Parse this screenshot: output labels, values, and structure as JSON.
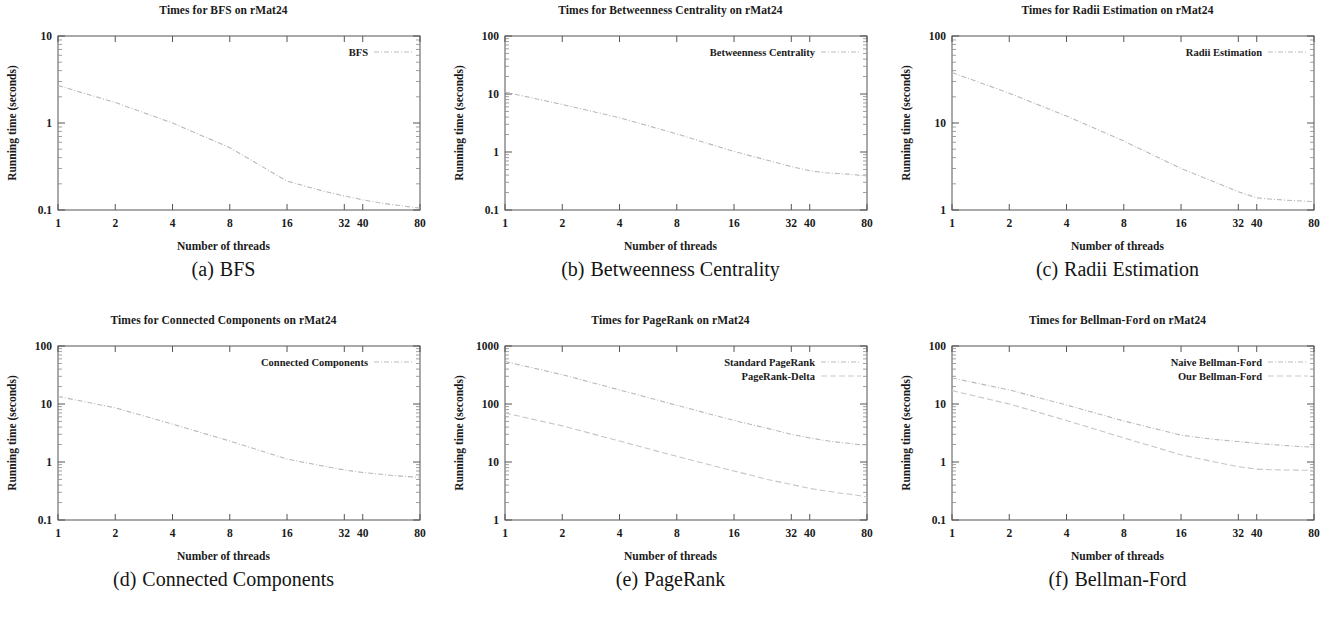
{
  "figure": {
    "dataset": "rMat24",
    "axis_titles": {
      "x": "Number of threads",
      "y": "Running time (seconds)"
    }
  },
  "panels": [
    {
      "id": "bfs",
      "letter": "(a)",
      "caption_text": "BFS",
      "title": "Times for BFS on rMat24",
      "xlabel": "Number of threads",
      "ylabel": "Running time (seconds)"
    },
    {
      "id": "betweenness-centrality",
      "letter": "(b)",
      "caption_text": "Betweenness Centrality",
      "title": "Times for Betweenness Centrality on rMat24",
      "xlabel": "Number of threads",
      "ylabel": "Running time (seconds)"
    },
    {
      "id": "radii-estimation",
      "letter": "(c)",
      "caption_text": "Radii Estimation",
      "title": "Times for Radii Estimation on rMat24",
      "xlabel": "Number of threads",
      "ylabel": "Running time (seconds)"
    },
    {
      "id": "connected-components",
      "letter": "(d)",
      "caption_text": "Connected Components",
      "title": "Times for Connected Components on rMat24",
      "xlabel": "Number of threads",
      "ylabel": "Running time (seconds)"
    },
    {
      "id": "pagerank",
      "letter": "(e)",
      "caption_text": "PageRank",
      "title": "Times for PageRank on rMat24",
      "xlabel": "Number of threads",
      "ylabel": "Running time (seconds)"
    },
    {
      "id": "bellman-ford",
      "letter": "(f)",
      "caption_text": "Bellman-Ford",
      "title": "Times for Bellman-Ford on rMat24",
      "xlabel": "Number of threads",
      "ylabel": "Running time (seconds)"
    }
  ],
  "chart_data": [
    {
      "type": "line",
      "panel": "a",
      "title": "Times for BFS on rMat24",
      "xlabel": "Number of threads",
      "ylabel": "Running time (seconds)",
      "xscale": "log",
      "yscale": "log",
      "xlim": [
        1,
        80
      ],
      "ylim": [
        0.1,
        10
      ],
      "xticks": [
        1,
        2,
        4,
        8,
        16,
        32,
        40,
        80
      ],
      "xticklabels": [
        "1",
        "2",
        "4",
        "8",
        "16",
        "32",
        "40",
        "80"
      ],
      "yticks": [
        0.1,
        1,
        10
      ],
      "yticklabels": [
        "0.1",
        "1",
        "10"
      ],
      "grid": false,
      "legend_position": "top-right",
      "x": [
        1,
        2,
        4,
        8,
        16,
        24,
        32,
        40,
        48,
        56,
        64,
        72,
        80
      ],
      "series": [
        {
          "name": "BFS",
          "values": [
            2.7,
            1.72,
            1.0,
            0.52,
            0.215,
            0.168,
            0.145,
            0.131,
            0.122,
            0.116,
            0.112,
            0.108,
            0.105
          ]
        }
      ]
    },
    {
      "type": "line",
      "panel": "b",
      "title": "Times for Betweenness Centrality on rMat24",
      "xlabel": "Number of threads",
      "ylabel": "Running time (seconds)",
      "xscale": "log",
      "yscale": "log",
      "xlim": [
        1,
        80
      ],
      "ylim": [
        0.1,
        100
      ],
      "xticks": [
        1,
        2,
        4,
        8,
        16,
        32,
        40,
        80
      ],
      "xticklabels": [
        "1",
        "2",
        "4",
        "8",
        "16",
        "32",
        "40",
        "80"
      ],
      "yticks": [
        0.1,
        1,
        10,
        100
      ],
      "yticklabels": [
        "0.1",
        "1",
        "10",
        "100"
      ],
      "grid": false,
      "legend_position": "top-right",
      "x": [
        1,
        2,
        4,
        8,
        16,
        24,
        32,
        40,
        48,
        56,
        64,
        72,
        80
      ],
      "series": [
        {
          "name": "Betweenness Centrality",
          "values": [
            10.8,
            6.6,
            3.9,
            2.05,
            1.02,
            0.72,
            0.56,
            0.475,
            0.44,
            0.425,
            0.415,
            0.4,
            0.385
          ]
        }
      ]
    },
    {
      "type": "line",
      "panel": "c",
      "title": "Times for Radii Estimation on rMat24",
      "xlabel": "Number of threads",
      "ylabel": "Running time (seconds)",
      "xscale": "log",
      "yscale": "log",
      "xlim": [
        1,
        80
      ],
      "ylim": [
        1,
        100
      ],
      "xticks": [
        1,
        2,
        4,
        8,
        16,
        32,
        40,
        80
      ],
      "xticklabels": [
        "1",
        "2",
        "4",
        "8",
        "16",
        "32",
        "40",
        "80"
      ],
      "yticks": [
        1,
        10,
        100
      ],
      "yticklabels": [
        "1",
        "10",
        "100"
      ],
      "grid": false,
      "legend_position": "top-right",
      "x": [
        1,
        2,
        4,
        8,
        16,
        24,
        32,
        40,
        48,
        56,
        64,
        72,
        80
      ],
      "series": [
        {
          "name": "Radii Estimation",
          "values": [
            38.0,
            22.0,
            12.0,
            6.2,
            3.0,
            2.1,
            1.62,
            1.38,
            1.33,
            1.3,
            1.28,
            1.26,
            1.25
          ]
        }
      ]
    },
    {
      "type": "line",
      "panel": "d",
      "title": "Times for Connected Components on rMat24",
      "xlabel": "Number of threads",
      "ylabel": "Running time (seconds)",
      "xscale": "log",
      "yscale": "log",
      "xlim": [
        1,
        80
      ],
      "ylim": [
        0.1,
        100
      ],
      "xticks": [
        1,
        2,
        4,
        8,
        16,
        32,
        40,
        80
      ],
      "xticklabels": [
        "1",
        "2",
        "4",
        "8",
        "16",
        "32",
        "40",
        "80"
      ],
      "yticks": [
        0.1,
        1,
        10,
        100
      ],
      "yticklabels": [
        "0.1",
        "1",
        "10",
        "100"
      ],
      "grid": false,
      "legend_position": "top-right",
      "x": [
        1,
        2,
        4,
        8,
        16,
        24,
        32,
        40,
        48,
        56,
        64,
        72,
        80
      ],
      "series": [
        {
          "name": "Connected Components",
          "values": [
            13.5,
            8.6,
            4.5,
            2.3,
            1.12,
            0.87,
            0.73,
            0.66,
            0.62,
            0.59,
            0.57,
            0.555,
            0.545
          ]
        }
      ]
    },
    {
      "type": "line",
      "panel": "e",
      "title": "Times for PageRank on rMat24",
      "xlabel": "Number of threads",
      "ylabel": "Running time (seconds)",
      "xscale": "log",
      "yscale": "log",
      "xlim": [
        1,
        80
      ],
      "ylim": [
        1,
        1000
      ],
      "xticks": [
        1,
        2,
        4,
        8,
        16,
        32,
        40,
        80
      ],
      "xticklabels": [
        "1",
        "2",
        "4",
        "8",
        "16",
        "32",
        "40",
        "80"
      ],
      "yticks": [
        1,
        10,
        100,
        1000
      ],
      "yticklabels": [
        "1",
        "10",
        "100",
        "1000"
      ],
      "grid": false,
      "legend_position": "top-right",
      "x": [
        1,
        2,
        4,
        8,
        16,
        24,
        32,
        40,
        48,
        56,
        64,
        72,
        80
      ],
      "series": [
        {
          "name": "Standard PageRank",
          "values": [
            540,
            320,
            175,
            95,
            52,
            38,
            30,
            26,
            23.5,
            22,
            21,
            20,
            19.5
          ]
        },
        {
          "name": "PageRank-Delta",
          "values": [
            70,
            42,
            23,
            12.5,
            7.0,
            5.0,
            4.1,
            3.5,
            3.2,
            2.95,
            2.8,
            2.65,
            2.5
          ]
        }
      ]
    },
    {
      "type": "line",
      "panel": "f",
      "title": "Times for Bellman-Ford on rMat24",
      "xlabel": "Number of threads",
      "ylabel": "Running time (seconds)",
      "xscale": "log",
      "yscale": "log",
      "xlim": [
        1,
        80
      ],
      "ylim": [
        0.1,
        100
      ],
      "xticks": [
        1,
        2,
        4,
        8,
        16,
        32,
        40,
        80
      ],
      "xticklabels": [
        "1",
        "2",
        "4",
        "8",
        "16",
        "32",
        "40",
        "80"
      ],
      "yticks": [
        0.1,
        1,
        10,
        100
      ],
      "yticklabels": [
        "0.1",
        "1",
        "10",
        "100"
      ],
      "grid": false,
      "legend_position": "top-right",
      "x": [
        1,
        2,
        4,
        8,
        16,
        24,
        32,
        40,
        48,
        56,
        64,
        72,
        80
      ],
      "series": [
        {
          "name": "Naive Bellman-Ford",
          "values": [
            28.0,
            17.5,
            9.6,
            5.1,
            2.9,
            2.45,
            2.25,
            2.1,
            2.0,
            1.92,
            1.87,
            1.83,
            1.8
          ]
        },
        {
          "name": "Our Bellman-Ford",
          "values": [
            17.0,
            10.0,
            5.2,
            2.6,
            1.33,
            1.0,
            0.83,
            0.755,
            0.735,
            0.73,
            0.725,
            0.72,
            0.72
          ]
        }
      ]
    }
  ]
}
